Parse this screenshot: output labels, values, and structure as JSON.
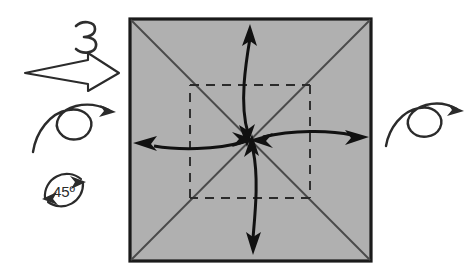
{
  "figure": {
    "step_number": "3",
    "angle_label": "45º"
  },
  "colors": {
    "paper_fill": "#b0b0b0",
    "paper_stroke": "#1a1a1a",
    "fold_line": "#3c3c3c",
    "dashed_line": "#2b2b2b",
    "arrow": "#111111",
    "background": "#ffffff"
  },
  "paper": {
    "name": "square-sheet",
    "x": 129,
    "y": 18,
    "width": 243,
    "height": 244,
    "diagonals": [
      "top-left-to-bottom-right",
      "top-right-to-bottom-left"
    ],
    "inner_dashed_square": {
      "x": 190,
      "y": 85,
      "width": 120,
      "height": 113
    }
  },
  "arrows": {
    "center": {
      "x": 252,
      "y": 140
    },
    "items": [
      {
        "name": "fold-arrow-up",
        "direction": "up",
        "double_headed": true
      },
      {
        "name": "fold-arrow-down",
        "direction": "down",
        "double_headed": true
      },
      {
        "name": "fold-arrow-left",
        "direction": "left",
        "double_headed": true
      },
      {
        "name": "fold-arrow-right",
        "direction": "right",
        "double_headed": true
      }
    ]
  },
  "annotations": {
    "block_arrow": {
      "name": "process-block-arrow",
      "direction": "right"
    },
    "loop_arrow_left": {
      "name": "turn-over-loop-arrow-left",
      "direction": "right"
    },
    "loop_arrow_right": {
      "name": "turn-over-loop-arrow-right",
      "direction": "right"
    },
    "rotate_symbol": {
      "name": "rotate-45-degrees-symbol",
      "label": "45º"
    }
  }
}
